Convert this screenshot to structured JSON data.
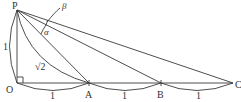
{
  "diagram": {
    "type": "geometry",
    "stroke_color": "#3a3a3a",
    "background": "#ffffff",
    "points": {
      "P": {
        "label": "P",
        "x": 17,
        "y": 10
      },
      "O": {
        "label": "O",
        "x": 17,
        "y": 83
      },
      "A": {
        "label": "A",
        "x": 89,
        "y": 83
      },
      "B": {
        "label": "B",
        "x": 161,
        "y": 83
      },
      "C": {
        "label": "C",
        "x": 233,
        "y": 83
      }
    },
    "segments": [
      "PO",
      "OC",
      "PA",
      "PB",
      "PC"
    ],
    "right_angle_at": "O",
    "angles": {
      "alpha": {
        "symbol": "α",
        "between": [
          "PA",
          "PB"
        ]
      },
      "beta": {
        "symbol": "β",
        "between": [
          "PB",
          "PC"
        ]
      }
    },
    "lengths": {
      "PO": "1",
      "OA": "1",
      "AB": "1",
      "BC": "1",
      "PA": "√2"
    }
  }
}
